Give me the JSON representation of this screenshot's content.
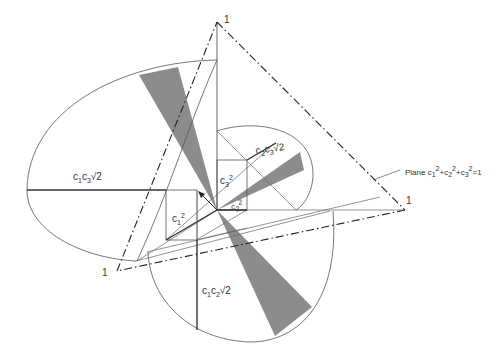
{
  "diagram": {
    "type": "geometric construction",
    "colors": {
      "line": "#555555",
      "bold_line": "#333333",
      "sector_fill": "#8c8c8c",
      "dashdot": "#222222"
    },
    "vertices": {
      "top": {
        "label": "1"
      },
      "right": {
        "label": "1"
      },
      "left": {
        "label": "1"
      }
    },
    "labels": {
      "c1c3": {
        "base": "c",
        "s1": "1",
        "mid": "c",
        "s2": "3",
        "tail": "√2"
      },
      "c2c3": {
        "base": "c",
        "s1": "2",
        "mid": "c",
        "s2": "3",
        "tail": "√2"
      },
      "c1c2": {
        "base": "c",
        "s1": "1",
        "mid": "c",
        "s2": "2",
        "tail": "√2"
      },
      "c1sq": {
        "base": "c",
        "sub": "1",
        "sup": "2"
      },
      "c2sq": {
        "base": "c",
        "sub": "2",
        "sup": "2"
      },
      "c3sq": {
        "base": "c",
        "sub": "3",
        "sup": "2"
      },
      "plane": {
        "prefix": "Plane c",
        "s1": "1",
        "p1": "2",
        "plus1": "+c",
        "s2": "2",
        "p2": "2",
        "plus2": "+c",
        "s3": "3",
        "p3": "2",
        "eq": "=1"
      }
    }
  }
}
